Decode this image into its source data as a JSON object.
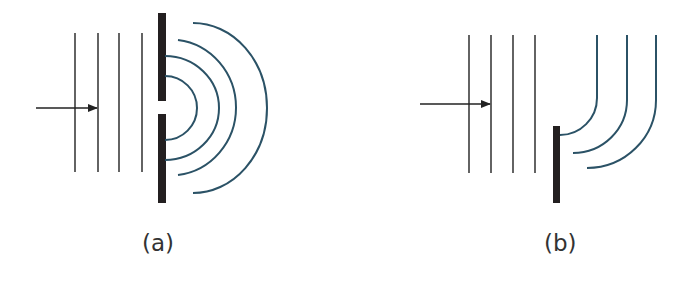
{
  "figure": {
    "colors": {
      "incident_wave": "#222222",
      "diffracted_wave": "#2b5266",
      "barrier": "#231f20",
      "label": "#333333"
    },
    "panels": [
      {
        "id": "a",
        "label": "(a)",
        "description": "Plane waves passing through a narrow slit spread out as semicircular wavefronts",
        "incident_wavefronts": 4,
        "diffracted_wavefronts": 4,
        "barrier": "wall with single narrow gap"
      },
      {
        "id": "b",
        "label": "(b)",
        "description": "Plane waves bending around the edge of a barrier",
        "incident_wavefronts": 4,
        "diffracted_wavefronts": 3,
        "barrier": "single edge"
      }
    ]
  }
}
